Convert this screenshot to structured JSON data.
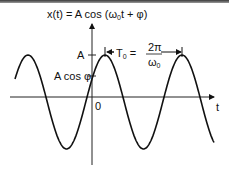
{
  "title": "x(t) = A cos (ω0t + φ)",
  "title_parts": {
    "pre": "x(t) = A cos (ω",
    "sub": "0",
    "post": "t + φ)"
  },
  "labels": {
    "A": "A",
    "A_cos_phi": "A cos φ",
    "origin": "0",
    "t_axis": "t",
    "period_lhs": "T",
    "period_lhs_sub": "0",
    "period_eq": "=",
    "period_num": "2π",
    "period_den": "ω",
    "period_den_sub": "0"
  },
  "chart_data": {
    "type": "line",
    "title": "x(t) = A cos (ω0t + φ)",
    "xlabel": "t",
    "ylabel": "x(t)",
    "annotations": [
      "A",
      "A cos φ",
      "0",
      "T0 = 2π/ω0"
    ],
    "series": [
      {
        "name": "x(t)",
        "function": "A cos(ω0 t + φ)",
        "peak_level": "A",
        "intercept_at_t0": "A cos φ",
        "period": "T0 = 2π/ω0"
      }
    ],
    "grid": false
  },
  "colors": {
    "line": "#111111",
    "background": "#ffffff"
  }
}
